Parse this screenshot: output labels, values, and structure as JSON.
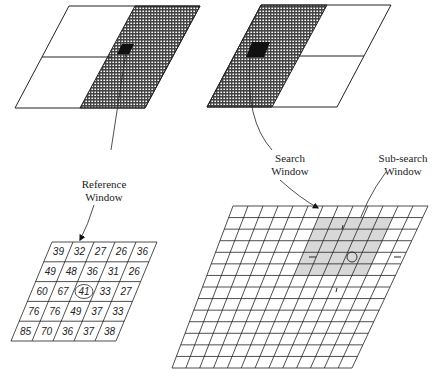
{
  "labels": {
    "reference_window": [
      "Reference",
      "Window"
    ],
    "search_window": [
      "Search",
      "Window"
    ],
    "sub_search_window": [
      "Sub-search",
      "Window"
    ]
  },
  "reference_block": {
    "rows": [
      [
        39,
        32,
        27,
        26,
        36
      ],
      [
        49,
        48,
        36,
        31,
        26
      ],
      [
        60,
        67,
        41,
        33,
        27
      ],
      [
        76,
        76,
        49,
        37,
        33
      ],
      [
        85,
        70,
        36,
        37,
        38
      ]
    ],
    "highlighted": {
      "row": 2,
      "col": 2,
      "value": 41
    }
  },
  "frames": {
    "left": {
      "hatched_half": "right",
      "block": "reference"
    },
    "right": {
      "hatched_half": "left",
      "block": "search"
    }
  },
  "search_grid": {
    "rows": 14,
    "cols": 13,
    "sub_window_rows": [
      1,
      5
    ],
    "sub_window_cols": [
      6,
      11
    ]
  },
  "colors": {
    "line": "#222222",
    "hatch": "#555555",
    "shade": "#d8d8d8",
    "block": "#111111"
  }
}
